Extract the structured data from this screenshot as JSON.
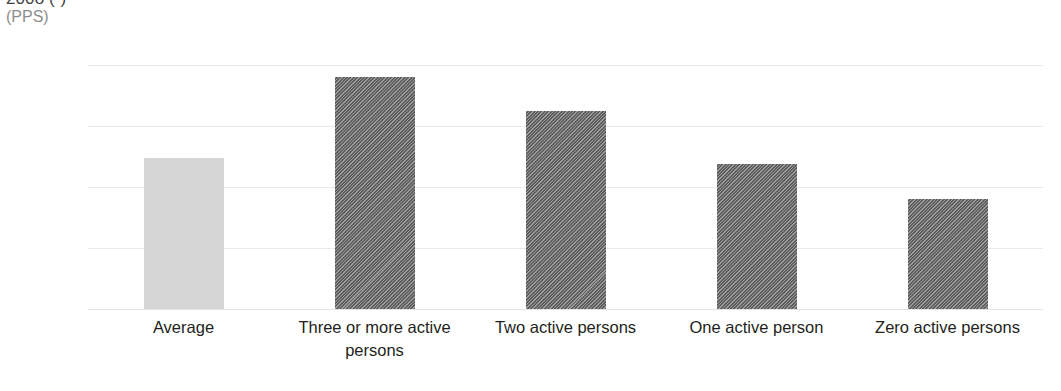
{
  "chart_data": {
    "type": "bar",
    "title": "2008 (¹)",
    "subtitle": "(PPS)",
    "xlabel": "",
    "ylabel": "",
    "ylim": [
      0,
      40000
    ],
    "grid": true,
    "legend": "none",
    "yticks": [
      "0",
      "10 000",
      "20 000",
      "30 000",
      "40 000"
    ],
    "ytick_values": [
      0,
      10000,
      20000,
      30000,
      40000
    ],
    "categories": [
      "Average",
      "Three or more active persons",
      "Two active persons",
      "One active person",
      "Zero active persons"
    ],
    "values": [
      24800,
      38000,
      32500,
      23700,
      18000
    ],
    "series": [
      {
        "name": "Median equivalised net income",
        "values": [
          24800,
          38000,
          32500,
          23700,
          18000
        ]
      }
    ],
    "bar_styles": [
      "solid",
      "hatch",
      "hatch",
      "hatch",
      "hatch"
    ],
    "colors": {
      "bar_average": "#d5d5d5",
      "bar_hatched": "#6f6f6f",
      "gridline": "#e9e9e9",
      "text": "#231f20",
      "subtitle_text": "#8d8d8d",
      "background": "#ffffff"
    }
  }
}
